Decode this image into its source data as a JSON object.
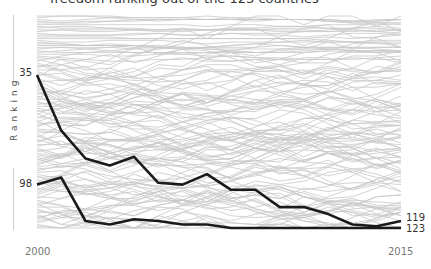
{
  "title": "freedom ranking out of the 123 countries",
  "ylabel": "Ranking",
  "x_start_label": "2000",
  "x_end_label": "2015",
  "start_labels": [
    "35",
    "98"
  ],
  "end_labels": [
    "119",
    "123"
  ],
  "colors": {
    "highlight": "#1a1a1a",
    "background_lines": "#c8c8c8",
    "text": "#333333"
  },
  "chart_data": {
    "type": "line",
    "title": "freedom ranking out of the 123 countries",
    "xlabel": "",
    "ylabel": "Ranking",
    "x": [
      2000,
      2001,
      2002,
      2003,
      2004,
      2005,
      2006,
      2007,
      2008,
      2009,
      2010,
      2011,
      2012,
      2013,
      2014,
      2015
    ],
    "ylim": [
      1,
      123
    ],
    "y_inverted": true,
    "grid": false,
    "legend": "none",
    "background_series_count": 123,
    "series": [
      {
        "name": "Country A",
        "values": [
          35,
          67,
          83,
          87,
          82,
          97,
          98,
          92,
          101,
          101,
          111,
          111,
          115,
          121,
          122,
          119
        ],
        "start_label": "35",
        "end_label": "119"
      },
      {
        "name": "Country B",
        "values": [
          98,
          94,
          119,
          121,
          118,
          119,
          121,
          121,
          123,
          123,
          123,
          123,
          123,
          123,
          123,
          123
        ],
        "start_label": "98",
        "end_label": "123"
      }
    ]
  }
}
